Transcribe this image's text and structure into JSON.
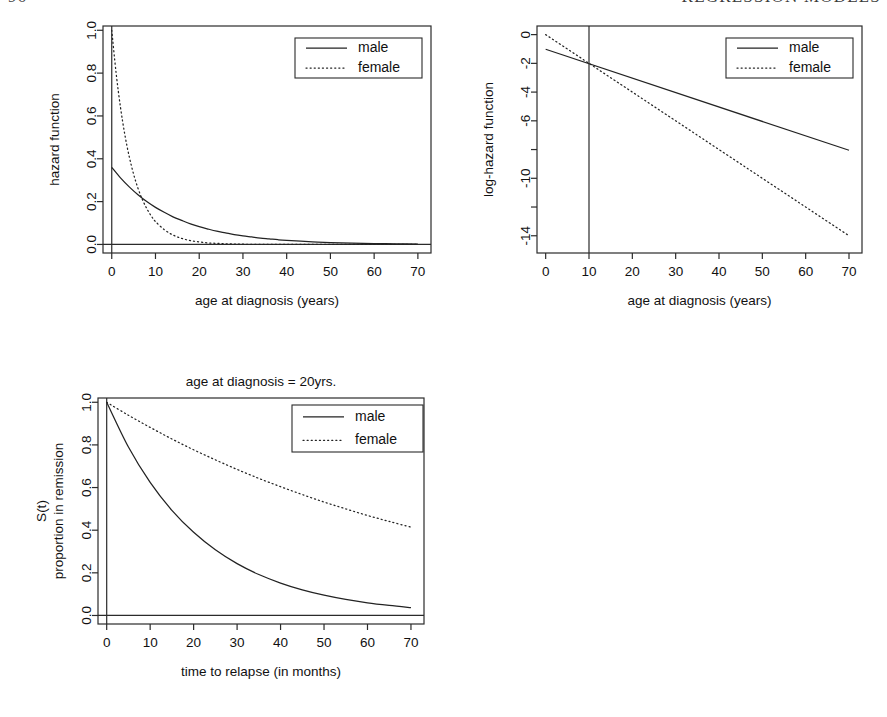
{
  "header": {
    "page_number": "96",
    "running_title": "REGRESSION MODELS"
  },
  "legend_labels": {
    "male": "male",
    "female": "female"
  },
  "chart_data": [
    {
      "id": "hazard-function",
      "type": "line",
      "title": "",
      "xlabel": "age at diagnosis (years)",
      "ylabel": "hazard function",
      "xlim": [
        -2,
        73
      ],
      "ylim": [
        -0.04,
        1.02
      ],
      "xticks": [
        0,
        10,
        20,
        30,
        40,
        50,
        60,
        70
      ],
      "xticklabels": [
        "0",
        "10",
        "20",
        "30",
        "40",
        "50",
        "60",
        "70"
      ],
      "yticks": [
        0.0,
        0.2,
        0.4,
        0.6,
        0.8,
        1.0
      ],
      "yticklabels": [
        "0.0",
        "0.2",
        "0.4",
        "0.6",
        "0.8",
        "1.0"
      ],
      "grid": false,
      "legend_position": "top-right",
      "reference_lines": [
        {
          "orientation": "vertical",
          "value": 0
        },
        {
          "orientation": "horizontal",
          "value": 0
        }
      ],
      "series": [
        {
          "name": "male",
          "style": "solid",
          "x": [
            0,
            2,
            4,
            6,
            8,
            10,
            12,
            14,
            16,
            18,
            20,
            22,
            24,
            26,
            28,
            30,
            32,
            34,
            36,
            38,
            40,
            45,
            50,
            55,
            60,
            65,
            70
          ],
          "values": [
            0.36,
            0.311,
            0.269,
            0.232,
            0.2,
            0.173,
            0.15,
            0.129,
            0.112,
            0.096,
            0.083,
            0.072,
            0.062,
            0.054,
            0.046,
            0.04,
            0.035,
            0.03,
            0.026,
            0.022,
            0.019,
            0.013,
            0.009,
            0.006,
            0.004,
            0.003,
            0.002
          ]
        },
        {
          "name": "female",
          "style": "dotted",
          "x": [
            0,
            1,
            2,
            3,
            4,
            5,
            6,
            7,
            8,
            9,
            10,
            12,
            14,
            16,
            18,
            20,
            22,
            24,
            26,
            28,
            30,
            35,
            40,
            45,
            50,
            55,
            60,
            65,
            70
          ],
          "values": [
            1.0,
            0.8,
            0.64,
            0.512,
            0.41,
            0.328,
            0.262,
            0.21,
            0.168,
            0.134,
            0.107,
            0.069,
            0.044,
            0.028,
            0.018,
            0.012,
            0.007,
            0.005,
            0.003,
            0.002,
            0.001,
            0.0,
            0.0,
            0.0,
            0.0,
            0.0,
            0.0,
            0.0,
            0.0
          ]
        }
      ]
    },
    {
      "id": "log-hazard-function",
      "type": "line",
      "title": "",
      "xlabel": "age at diagnosis (years)",
      "ylabel": "log-hazard function",
      "xlim": [
        -2,
        73
      ],
      "ylim": [
        -15.2,
        0.6
      ],
      "xticks": [
        0,
        10,
        20,
        30,
        40,
        50,
        60,
        70
      ],
      "xticklabels": [
        "0",
        "10",
        "20",
        "30",
        "40",
        "50",
        "60",
        "70"
      ],
      "yticks": [
        0,
        -2,
        -4,
        -6,
        -8,
        -10,
        -12,
        -14
      ],
      "yticklabels": [
        "0",
        "-2",
        "-4",
        "-6",
        "",
        "-10",
        "",
        "-14"
      ],
      "grid": false,
      "legend_position": "top-right",
      "reference_lines": [
        {
          "orientation": "vertical",
          "value": 10
        }
      ],
      "series": [
        {
          "name": "male",
          "style": "solid",
          "x": [
            0,
            70
          ],
          "values": [
            -1.02,
            -8.05
          ]
        },
        {
          "name": "female",
          "style": "dotted",
          "x": [
            0,
            70
          ],
          "values": [
            0.0,
            -14.0
          ]
        }
      ]
    },
    {
      "id": "survival-function",
      "type": "line",
      "title": "age at diagnosis = 20yrs.",
      "xlabel": "time to relapse (in months)",
      "ylabel": "S(t)",
      "ylabel2": "proportion in remission",
      "xlim": [
        -2,
        73
      ],
      "ylim": [
        -0.04,
        1.02
      ],
      "xticks": [
        0,
        10,
        20,
        30,
        40,
        50,
        60,
        70
      ],
      "xticklabels": [
        "0",
        "10",
        "20",
        "30",
        "40",
        "50",
        "60",
        "70"
      ],
      "yticks": [
        0.0,
        0.2,
        0.4,
        0.6,
        0.8,
        1.0
      ],
      "yticklabels": [
        "0.0",
        "0.2",
        "0.4",
        "0.6",
        "0.8",
        "1.0"
      ],
      "grid": false,
      "legend_position": "top-right",
      "reference_lines": [
        {
          "orientation": "vertical",
          "value": 0
        },
        {
          "orientation": "horizontal",
          "value": 0
        }
      ],
      "series": [
        {
          "name": "male",
          "style": "solid",
          "x": [
            0,
            5,
            10,
            15,
            20,
            25,
            30,
            35,
            40,
            45,
            50,
            55,
            60,
            65,
            70
          ],
          "values": [
            1.0,
            0.79,
            0.624,
            0.493,
            0.39,
            0.308,
            0.243,
            0.192,
            0.152,
            0.12,
            0.095,
            0.075,
            0.059,
            0.047,
            0.037
          ]
        },
        {
          "name": "female",
          "style": "dotted",
          "x": [
            0,
            5,
            10,
            15,
            20,
            25,
            30,
            35,
            40,
            45,
            50,
            55,
            60,
            65,
            70
          ],
          "values": [
            1.0,
            0.939,
            0.882,
            0.828,
            0.777,
            0.73,
            0.685,
            0.643,
            0.604,
            0.567,
            0.532,
            0.5,
            0.469,
            0.441,
            0.414
          ]
        }
      ]
    }
  ]
}
